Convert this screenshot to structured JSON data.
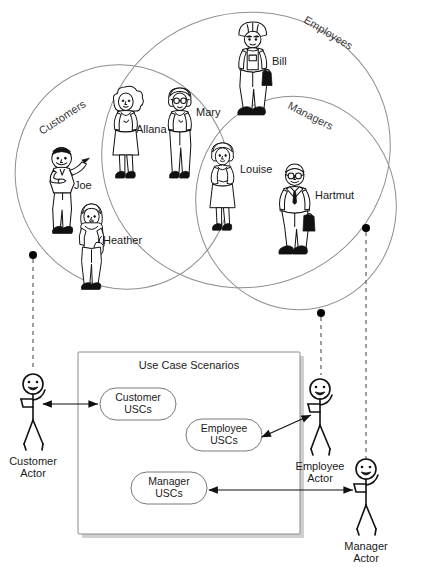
{
  "diagram": {
    "type": "uml-use-case-venn",
    "venn": {
      "sets": [
        {
          "id": "customers",
          "label": "Customers"
        },
        {
          "id": "employees",
          "label": "Employees"
        },
        {
          "id": "managers",
          "label": "Managers"
        }
      ],
      "people": [
        {
          "name": "Joe",
          "sets": [
            "customers"
          ],
          "role": "waving-man"
        },
        {
          "name": "Heather",
          "sets": [
            "customers"
          ],
          "role": "woman-handbag"
        },
        {
          "name": "Allana",
          "sets": [
            "customers",
            "employees"
          ],
          "role": "woman-dress-curly"
        },
        {
          "name": "Mary",
          "sets": [
            "customers",
            "employees"
          ],
          "role": "woman-glasses-pants"
        },
        {
          "name": "Bill",
          "sets": [
            "employees"
          ],
          "role": "construction-worker"
        },
        {
          "name": "Louise",
          "sets": [
            "customers",
            "employees",
            "managers"
          ],
          "role": "woman-skirt"
        },
        {
          "name": "Hartmut",
          "sets": [
            "employees",
            "managers"
          ],
          "role": "businessman-briefcase"
        }
      ]
    },
    "scenario_box": {
      "title": "Use Case Scenarios",
      "use_case_sets": [
        {
          "id": "customer-uscs",
          "line1": "Customer",
          "line2": "USCs"
        },
        {
          "id": "employee-uscs",
          "line1": "Employee",
          "line2": "USCs"
        },
        {
          "id": "manager-uscs",
          "line1": "Manager",
          "line2": "USCs"
        }
      ]
    },
    "actors": [
      {
        "id": "customer-actor",
        "line1": "Customer",
        "line2": "Actor"
      },
      {
        "id": "employee-actor",
        "line1": "Employee",
        "line2": "Actor"
      },
      {
        "id": "manager-actor",
        "line1": "Manager",
        "line2": "Actor"
      }
    ],
    "colors": {
      "venn_stroke": "#8f8f8f",
      "dashed_link": "#6b6b6b",
      "ink": "#111111",
      "shadow": "#cfcfcf"
    }
  }
}
